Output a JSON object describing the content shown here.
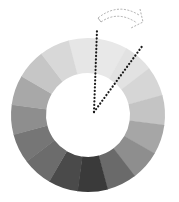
{
  "diagram": {
    "type": "grayscale-color-wheel",
    "center": [
      88,
      115
    ],
    "outer_radius": 77,
    "inner_radius": 42,
    "segment_start_angle_deg": -105,
    "segments": [
      {
        "shade": "#e6e6e6"
      },
      {
        "shade": "#e8e8e8"
      },
      {
        "shade": "#e2e2e2"
      },
      {
        "shade": "#d6d6d6"
      },
      {
        "shade": "#c4c4c4"
      },
      {
        "shade": "#a6a6a6"
      },
      {
        "shade": "#8e8e8e"
      },
      {
        "shade": "#6a6a6a"
      },
      {
        "shade": "#3a3a3a"
      },
      {
        "shade": "#4a4a4a"
      },
      {
        "shade": "#6c6c6c"
      },
      {
        "shade": "#767676"
      },
      {
        "shade": "#8e8e8e"
      },
      {
        "shade": "#a8a8a8"
      },
      {
        "shade": "#c6c6c6"
      },
      {
        "shade": "#d8d8d8"
      }
    ],
    "pointer_lines": [
      {
        "from": [
          94,
          112
        ],
        "to": [
          97,
          30
        ]
      },
      {
        "from": [
          94,
          112
        ],
        "to": [
          143,
          45
        ]
      }
    ],
    "rotation_arrow": {
      "from": [
        98,
        18
      ],
      "to": [
        143,
        27
      ],
      "style": "dashed-curved"
    },
    "colors": {
      "dot": "#1a1a1a",
      "arrow": "#9a9a9a",
      "background": "#ffffff"
    }
  }
}
